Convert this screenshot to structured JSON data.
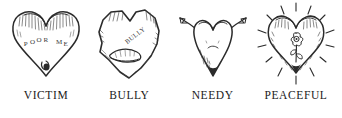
{
  "figure": {
    "background_color": "#ffffff",
    "ink_color": "#2b2b2b",
    "panels": [
      {
        "id": "victim",
        "caption": "VICTIM",
        "icon_name": "victim-heart-icon",
        "inscription": "POOR ME",
        "description": "Heart with heavy shading on top lobes, words POOR ME written in an arc across the middle, and a teardrop hanging from the bottom point"
      },
      {
        "id": "bully",
        "caption": "BULLY",
        "icon_name": "bully-heart-icon",
        "inscription": "BULLY",
        "description": "Jagged angular heart with the word BULLY written diagonally and a snarling open mouth with teeth"
      },
      {
        "id": "needy",
        "caption": "NEEDY",
        "icon_name": "needy-heart-icon",
        "inscription": "",
        "description": "Narrow heart with a small downturned frown and two long arms with open hands reaching upward and outward"
      },
      {
        "id": "peaceful",
        "caption": "PEACEFUL",
        "icon_name": "peaceful-heart-icon",
        "inscription": "",
        "description": "Heart radiating light rays all around with a flower and stem at its center"
      }
    ]
  }
}
